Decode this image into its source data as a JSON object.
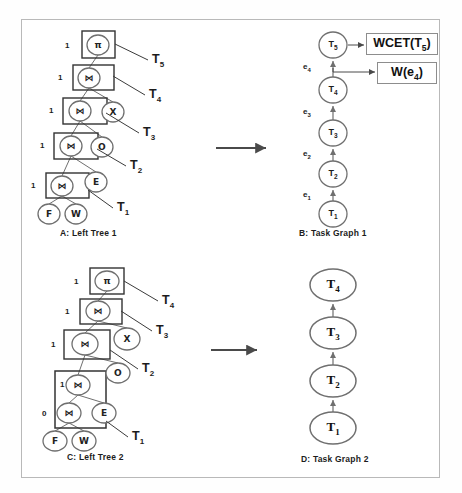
{
  "figure": {
    "border_color": "#b9b9b9",
    "background": "#ffffff",
    "stroke_color": "#6f6f6f",
    "arrow_color": "#4a4a4a"
  },
  "panels": {
    "a": {
      "caption": "A: Left Tree 1",
      "nodes": [
        {
          "id": "a-pi",
          "glyph": "π",
          "shape": "circle",
          "cx": 98,
          "cy": 45,
          "rx": 11,
          "ry": 10,
          "boxed": true,
          "box": {
            "x": 82,
            "y": 31,
            "w": 33,
            "h": 27
          },
          "cost": "1",
          "cost_x": 65,
          "cost_y": 41
        },
        {
          "id": "a-j4",
          "glyph": "⋈",
          "shape": "circle",
          "cx": 89,
          "cy": 78,
          "rx": 11,
          "ry": 10,
          "boxed": true,
          "box": {
            "x": 73,
            "y": 65,
            "w": 41,
            "h": 25
          },
          "cost": "1",
          "cost_x": 58,
          "cost_y": 73
        },
        {
          "id": "a-j3",
          "glyph": "⋈",
          "shape": "circle",
          "cx": 80,
          "cy": 111,
          "rx": 11,
          "ry": 10,
          "boxed": true,
          "box": {
            "x": 63,
            "y": 98,
            "w": 44,
            "h": 26
          },
          "cost": "1",
          "cost_x": 49,
          "cost_y": 106
        },
        {
          "id": "a-j2",
          "glyph": "⋈",
          "shape": "circle",
          "cx": 71,
          "cy": 146,
          "rx": 11,
          "ry": 10,
          "boxed": true,
          "box": {
            "x": 54,
            "y": 133,
            "w": 44,
            "h": 26
          },
          "cost": "1",
          "cost_x": 40,
          "cost_y": 141
        },
        {
          "id": "a-j1",
          "glyph": "⋈",
          "shape": "circle",
          "cx": 62,
          "cy": 186,
          "rx": 11,
          "ry": 10,
          "boxed": true,
          "box": {
            "x": 46,
            "y": 173,
            "w": 43,
            "h": 25
          },
          "cost": "1",
          "cost_x": 31,
          "cost_y": 181
        },
        {
          "id": "a-x",
          "glyph": "X",
          "shape": "circle",
          "cx": 113,
          "cy": 112,
          "rx": 11,
          "ry": 10,
          "boxed": false
        },
        {
          "id": "a-o",
          "glyph": "O",
          "shape": "circle",
          "cx": 102,
          "cy": 147,
          "rx": 11,
          "ry": 10,
          "boxed": false
        },
        {
          "id": "a-e",
          "glyph": "E",
          "shape": "circle",
          "cx": 96,
          "cy": 182,
          "rx": 11,
          "ry": 10,
          "boxed": false
        },
        {
          "id": "a-f",
          "glyph": "F",
          "shape": "circle",
          "cx": 49,
          "cy": 214,
          "rx": 11,
          "ry": 10,
          "boxed": false
        },
        {
          "id": "a-w",
          "glyph": "W",
          "shape": "circle",
          "cx": 76,
          "cy": 214,
          "rx": 11,
          "ry": 10,
          "boxed": false
        }
      ],
      "edges": [
        [
          "a-pi",
          "a-j4"
        ],
        [
          "a-j4",
          "a-j3"
        ],
        [
          "a-j4",
          "a-x"
        ],
        [
          "a-j3",
          "a-j2"
        ],
        [
          "a-j3",
          "a-o"
        ],
        [
          "a-j2",
          "a-j1"
        ],
        [
          "a-j2",
          "a-e"
        ],
        [
          "a-j1",
          "a-f"
        ],
        [
          "a-j1",
          "a-w"
        ]
      ],
      "task_leaders": [
        {
          "label": "T",
          "sub": "5",
          "x1": 115,
          "y1": 44,
          "x2": 148,
          "y2": 60,
          "tx": 152,
          "ty": 52
        },
        {
          "label": "T",
          "sub": "4",
          "x1": 113,
          "y1": 76,
          "x2": 145,
          "y2": 95,
          "tx": 149,
          "ty": 87
        },
        {
          "label": "T",
          "sub": "3",
          "x1": 106,
          "y1": 113,
          "x2": 139,
          "y2": 133,
          "tx": 143,
          "ty": 125
        },
        {
          "label": "T",
          "sub": "2",
          "x1": 97,
          "y1": 149,
          "x2": 126,
          "y2": 166,
          "tx": 130,
          "ty": 158
        },
        {
          "label": "T",
          "sub": "1",
          "x1": 88,
          "y1": 190,
          "x2": 113,
          "y2": 208,
          "tx": 117,
          "ty": 200
        }
      ]
    },
    "b": {
      "caption": "B: Task Graph 1",
      "nodes": [
        {
          "id": "b-t5",
          "label": "T",
          "sub": "5",
          "cx": 333,
          "cy": 45,
          "rx": 14,
          "ry": 13
        },
        {
          "id": "b-t4",
          "label": "T",
          "sub": "4",
          "cx": 333,
          "cy": 90,
          "rx": 14,
          "ry": 13
        },
        {
          "id": "b-t3",
          "label": "T",
          "sub": "3",
          "cx": 333,
          "cy": 133,
          "rx": 14,
          "ry": 13
        },
        {
          "id": "b-t2",
          "label": "T",
          "sub": "2",
          "cx": 333,
          "cy": 174,
          "rx": 14,
          "ry": 13
        },
        {
          "id": "b-t1",
          "label": "T",
          "sub": "1",
          "cx": 333,
          "cy": 214,
          "rx": 14,
          "ry": 13
        }
      ],
      "edge_labels": [
        {
          "label": "e",
          "sub": "4",
          "x": 303,
          "y": 62
        },
        {
          "label": "e",
          "sub": "3",
          "x": 303,
          "y": 107
        },
        {
          "label": "e",
          "sub": "2",
          "x": 303,
          "y": 149
        },
        {
          "label": "e",
          "sub": "1",
          "x": 303,
          "y": 190
        }
      ],
      "annotations": [
        {
          "id": "wcet-box",
          "text": "WCET(T",
          "sub": "5",
          "tail": ")",
          "x": 366,
          "y": 33,
          "w": 72,
          "h": 22,
          "from_x": 348,
          "from_y": 45,
          "to_x": 364,
          "to_y": 45
        },
        {
          "id": "w-edge-box",
          "text": "W(e",
          "sub": "4",
          "tail": ")",
          "x": 377,
          "y": 62,
          "w": 60,
          "h": 22,
          "from_x": 333,
          "from_y": 68,
          "to_x": 375,
          "to_y": 72
        }
      ]
    },
    "c": {
      "caption": "C: Left Tree 2",
      "nodes": [
        {
          "id": "c-pi",
          "glyph": "π",
          "shape": "ellipse",
          "cx": 107,
          "cy": 281,
          "rx": 12,
          "ry": 10,
          "boxed": true,
          "box": {
            "x": 90,
            "y": 268,
            "w": 34,
            "h": 26
          },
          "cost": "1",
          "cost_x": 74,
          "cost_y": 277
        },
        {
          "id": "c-j3",
          "glyph": "⋈",
          "shape": "ellipse",
          "cx": 98,
          "cy": 311,
          "rx": 12,
          "ry": 10,
          "boxed": true,
          "box": {
            "x": 80,
            "y": 299,
            "w": 42,
            "h": 25
          },
          "cost": "1",
          "cost_x": 65,
          "cost_y": 307
        },
        {
          "id": "c-j2",
          "glyph": "⋈",
          "shape": "ellipse",
          "cx": 85,
          "cy": 344,
          "rx": 13,
          "ry": 11,
          "boxed": true,
          "box": {
            "x": 64,
            "y": 330,
            "w": 46,
            "h": 29
          },
          "cost": "1",
          "cost_x": 51,
          "cost_y": 340
        },
        {
          "id": "c-j1",
          "glyph": "⋈",
          "shape": "ellipse",
          "cx": 78,
          "cy": 385,
          "rx": 12,
          "ry": 10,
          "boxed": false
        },
        {
          "id": "c-j0",
          "glyph": "⋈",
          "shape": "ellipse",
          "cx": 69,
          "cy": 413,
          "rx": 12,
          "ry": 10,
          "boxed": false
        },
        {
          "id": "c-x",
          "glyph": "X",
          "shape": "ellipse",
          "cx": 127,
          "cy": 339,
          "rx": 13,
          "ry": 11,
          "boxed": false
        },
        {
          "id": "c-o",
          "glyph": "O",
          "shape": "ellipse",
          "cx": 118,
          "cy": 373,
          "rx": 12,
          "ry": 10,
          "boxed": false
        },
        {
          "id": "c-e",
          "glyph": "E",
          "shape": "ellipse",
          "cx": 104,
          "cy": 413,
          "rx": 12,
          "ry": 10,
          "boxed": false
        },
        {
          "id": "c-f",
          "glyph": "F",
          "shape": "ellipse",
          "cx": 55,
          "cy": 441,
          "rx": 12,
          "ry": 10,
          "boxed": false
        },
        {
          "id": "c-w",
          "glyph": "W",
          "shape": "ellipse",
          "cx": 84,
          "cy": 441,
          "rx": 12,
          "ry": 10,
          "boxed": false
        }
      ],
      "group_box": {
        "x": 55,
        "y": 371,
        "w": 51,
        "h": 57,
        "inner_cost": "1",
        "inner_cost_x": 60,
        "inner_cost_y": 380,
        "outer_cost": "0",
        "outer_cost_x": 42,
        "outer_cost_y": 409
      },
      "edges": [
        [
          "c-pi",
          "c-j3"
        ],
        [
          "c-j3",
          "c-j2"
        ],
        [
          "c-j3",
          "c-x"
        ],
        [
          "c-j2",
          "c-j1"
        ],
        [
          "c-j2",
          "c-o"
        ],
        [
          "c-j1",
          "c-j0"
        ],
        [
          "c-j1",
          "c-e"
        ],
        [
          "c-j0",
          "c-f"
        ],
        [
          "c-j0",
          "c-w"
        ]
      ],
      "task_leaders": [
        {
          "label": "T",
          "sub": "4",
          "x1": 124,
          "y1": 281,
          "x2": 158,
          "y2": 301,
          "tx": 162,
          "ty": 293
        },
        {
          "label": "T",
          "sub": "3",
          "x1": 121,
          "y1": 311,
          "x2": 152,
          "y2": 331,
          "tx": 156,
          "ty": 323
        },
        {
          "label": "T",
          "sub": "2",
          "x1": 110,
          "y1": 350,
          "x2": 138,
          "y2": 369,
          "tx": 142,
          "ty": 361
        },
        {
          "label": "T",
          "sub": "1",
          "x1": 106,
          "y1": 421,
          "x2": 128,
          "y2": 437,
          "tx": 132,
          "ty": 429
        }
      ]
    },
    "d": {
      "caption": "D: Task Graph 2",
      "nodes": [
        {
          "id": "d-t4",
          "label": "T",
          "sub": "4",
          "cx": 333,
          "cy": 285,
          "rx": 23,
          "ry": 16
        },
        {
          "id": "d-t3",
          "label": "T",
          "sub": "3",
          "cx": 333,
          "cy": 333,
          "rx": 23,
          "ry": 16
        },
        {
          "id": "d-t2",
          "label": "T",
          "sub": "2",
          "cx": 333,
          "cy": 381,
          "rx": 23,
          "ry": 16
        },
        {
          "id": "d-t1",
          "label": "T",
          "sub": "1",
          "cx": 333,
          "cy": 428,
          "rx": 23,
          "ry": 16
        }
      ]
    }
  },
  "transform_arrows": [
    {
      "id": "arrow-top",
      "x1": 216,
      "y1": 148,
      "x2": 266,
      "y2": 148
    },
    {
      "id": "arrow-bottom",
      "x1": 211,
      "y1": 350,
      "x2": 257,
      "y2": 350
    }
  ],
  "captions": {
    "a_x": 60,
    "a_y": 234,
    "b_x": 299,
    "b_y": 234,
    "c_x": 67,
    "c_y": 458,
    "d_x": 301,
    "d_y": 460
  }
}
